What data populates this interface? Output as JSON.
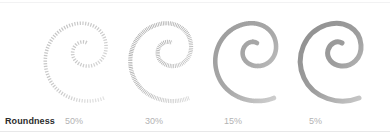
{
  "panel": {
    "row_title": "Roundness",
    "divider_color": "#e8e8e9",
    "background_color": "#ffffff",
    "title_color": "#2b2b2b",
    "value_color": "#b3b3b3",
    "stroke_color": "#7a7a7a"
  },
  "samples": [
    {
      "index": 0,
      "value_label": "50%",
      "roundness_percent": 50,
      "icon": "spiral-stroke-icon",
      "render": "dashed-hatch",
      "dash": "1.2 1.5",
      "stroke_width": 3.6,
      "opacity": 0.52
    },
    {
      "index": 1,
      "value_label": "30%",
      "roundness_percent": 30,
      "icon": "spiral-stroke-icon",
      "render": "fine-hatch",
      "dash": "0.8 0.9",
      "stroke_width": 4.2,
      "opacity": 0.66
    },
    {
      "index": 2,
      "value_label": "15%",
      "roundness_percent": 15,
      "icon": "spiral-stroke-icon",
      "render": "near-solid",
      "dash": "0.45 0.3",
      "stroke_width": 4.6,
      "opacity": 0.72
    },
    {
      "index": 3,
      "value_label": "5%",
      "roundness_percent": 5,
      "icon": "spiral-stroke-icon",
      "render": "solid",
      "dash": "0 0",
      "stroke_width": 5.0,
      "opacity": 0.78
    }
  ]
}
